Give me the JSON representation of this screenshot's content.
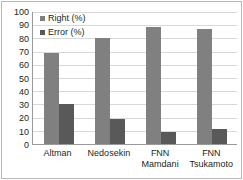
{
  "chart_data": {
    "type": "bar",
    "title": "",
    "subtitle": "",
    "xlabel": "",
    "ylabel": "",
    "ylim": [
      0,
      100
    ],
    "ytick_step": 10,
    "yticks": [
      100,
      90,
      80,
      70,
      60,
      50,
      40,
      30,
      20,
      10,
      0
    ],
    "grid": true,
    "legend_position": "top-left",
    "categories": [
      "Altman",
      "Nedosekin",
      "FNN Mamdani",
      "FNN Tsukamoto"
    ],
    "category_lines": [
      [
        "Altman"
      ],
      [
        "Nedosekin"
      ],
      [
        "FNN",
        "Mamdani"
      ],
      [
        "FNN",
        "Tsukamoto"
      ]
    ],
    "series": [
      {
        "name": "Right (%)",
        "color": "#808080",
        "values": [
          69,
          80,
          89,
          87
        ]
      },
      {
        "name": "Error (%)",
        "color": "#595959",
        "values": [
          30,
          19,
          9,
          11
        ]
      }
    ]
  },
  "legend": {
    "items": [
      {
        "label": "Right (%)"
      },
      {
        "label": "Error (%)"
      }
    ]
  }
}
